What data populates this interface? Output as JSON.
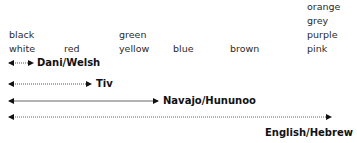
{
  "columns": [
    {
      "id": "col1",
      "terms": [
        "black",
        "white"
      ]
    },
    {
      "id": "col2",
      "terms": [
        "red"
      ]
    },
    {
      "id": "col3",
      "terms": [
        "green",
        "yellow"
      ]
    },
    {
      "id": "col4",
      "terms": [
        "blue"
      ]
    },
    {
      "id": "col5",
      "terms": [
        "brown"
      ]
    },
    {
      "id": "col6",
      "terms": [
        "orange",
        "grey",
        "purple",
        "pink"
      ]
    }
  ],
  "arrows": [
    {
      "label": "Dani/Welsh",
      "x1": 10,
      "x2": 32,
      "y": 63,
      "label_x": 37,
      "label_y": 57
    },
    {
      "label": "Tiv",
      "x1": 10,
      "x2": 90,
      "y": 84,
      "label_x": 96,
      "label_y": 78
    },
    {
      "label": "Navajo/Hununoo",
      "x1": 10,
      "x2": 157,
      "y": 102,
      "label_x": 164,
      "label_y": 96
    },
    {
      "label": "English/Hebrew",
      "x1": 10,
      "x2": 330,
      "y": 118,
      "label_x": 266,
      "label_y": 128
    }
  ],
  "colors": {
    "text": "#2a2a2a",
    "label": "#111111",
    "line": "#555555",
    "background": "#ffffff"
  }
}
